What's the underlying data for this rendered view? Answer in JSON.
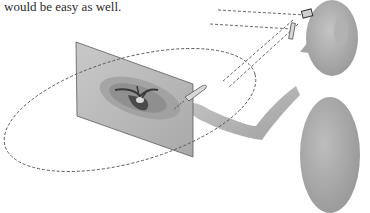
{
  "text": {
    "partial_line_above": "...",
    "line": "would be easy as well."
  },
  "figure": {
    "elements": [
      "image-plane",
      "scan-image",
      "dashed-orbit-ellipse",
      "dashed-sight-lines",
      "head",
      "head-tracker",
      "tracker-marker",
      "arm",
      "hand-tool",
      "body"
    ],
    "colors": {
      "figure_gray": "#a8a8a8",
      "figure_shade": "#8f8f8f",
      "plane_fill": "#bdbdbd",
      "plane_edge": "#5a5a5a",
      "dash": "#555555",
      "scan_dark": "#3a3a3a"
    }
  }
}
